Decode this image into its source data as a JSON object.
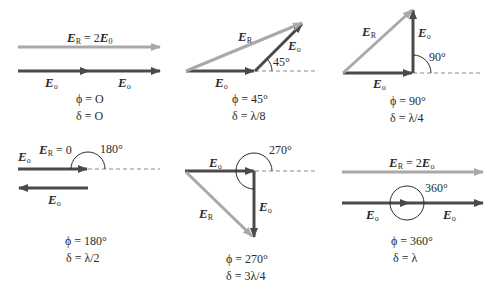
{
  "colors": {
    "component_vector": "#4a4a4a",
    "resultant_vector": "#a9a9a9",
    "dashed_reference": "#8a8a8a",
    "angle_arc": "#2a2a2a"
  },
  "vector_labels": {
    "component": "E",
    "component_sub": "o",
    "resultant": "E",
    "resultant_sub": "R"
  },
  "panels": [
    {
      "id": "phi-0",
      "resultant_annotation": "= 2",
      "resultant_annotation_tail_vec": "E",
      "resultant_annotation_tail_sub": "0",
      "angle_label": "",
      "phi": "ϕ = O",
      "delta": "δ = O"
    },
    {
      "id": "phi-45",
      "angle_label": "45°",
      "phi": "ϕ = 45°",
      "delta": "δ = λ/8"
    },
    {
      "id": "phi-90",
      "angle_label": "90°",
      "phi": "ϕ = 90°",
      "delta": "δ = λ/4"
    },
    {
      "id": "phi-180",
      "resultant_annotation": "= 0",
      "angle_label": "180°",
      "phi": "ϕ = 180°",
      "delta": "δ = λ/2"
    },
    {
      "id": "phi-270",
      "angle_label": "270°",
      "phi": "ϕ = 270°",
      "delta": "δ = 3λ/4"
    },
    {
      "id": "phi-360",
      "resultant_annotation": "= 2",
      "resultant_annotation_tail_vec": "E",
      "resultant_annotation_tail_sub": "o",
      "angle_label": "360°",
      "phi": "ϕ = 360°",
      "delta": "δ = λ"
    }
  ]
}
